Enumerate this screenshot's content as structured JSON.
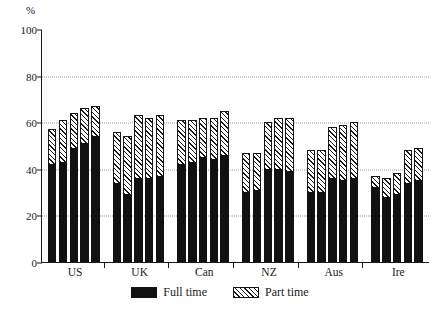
{
  "chart_data": {
    "type": "bar",
    "subtype": "stacked-grouped-bar",
    "title": "",
    "subtitle": "",
    "xlabel": "",
    "ylabel": "%",
    "ylim": [
      0,
      100
    ],
    "yticks": [
      0,
      20,
      40,
      60,
      80,
      100
    ],
    "ytick_labels": [
      "0",
      "20",
      "40",
      "60",
      "80",
      "100"
    ],
    "grid": "horizontal-dotted",
    "gridlines_at": [
      20,
      40,
      60,
      80
    ],
    "legend_position": "bottom-center",
    "categories": [
      "US",
      "UK",
      "Can",
      "NZ",
      "Aus",
      "Ire"
    ],
    "bars_per_category": 5,
    "series": [
      {
        "name": "Full time",
        "color": "#111111",
        "fill": "solid",
        "values": [
          [
            42,
            43,
            49,
            51,
            54
          ],
          [
            34,
            29,
            36,
            36,
            37
          ],
          [
            42,
            43,
            45,
            44,
            46
          ],
          [
            30,
            31,
            40,
            40,
            39
          ],
          [
            30,
            30,
            36,
            35,
            36
          ],
          [
            32,
            28,
            29,
            34,
            35
          ]
        ]
      },
      {
        "name": "Part time",
        "color": "#ffffff",
        "fill": "diagonal-hatch",
        "values": [
          [
            15,
            18,
            15,
            15,
            13
          ],
          [
            22,
            25,
            27,
            26,
            26
          ],
          [
            19,
            18,
            17,
            18,
            19
          ],
          [
            17,
            16,
            20,
            22,
            23
          ],
          [
            18,
            18,
            22,
            24,
            24
          ],
          [
            5,
            8,
            9,
            14,
            14
          ]
        ]
      }
    ],
    "totals": [
      [
        57,
        61,
        64,
        66,
        67
      ],
      [
        56,
        54,
        63,
        62,
        63
      ],
      [
        61,
        61,
        62,
        62,
        65
      ],
      [
        47,
        47,
        60,
        62,
        62
      ],
      [
        48,
        48,
        58,
        59,
        60
      ],
      [
        37,
        36,
        38,
        48,
        49
      ]
    ]
  },
  "axis": {
    "y_unit_label": "%"
  },
  "legend": {
    "items": [
      {
        "label": "Full time",
        "swatch": "solid-black-swatch"
      },
      {
        "label": "Part time",
        "swatch": "hatched-swatch"
      }
    ]
  }
}
